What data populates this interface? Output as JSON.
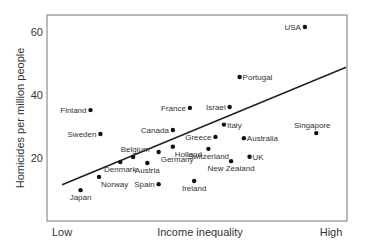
{
  "chart_data": {
    "type": "scatter",
    "title": "",
    "xlabel": "Income inequality",
    "ylabel": "Homicides per million people",
    "x_tick_labels": {
      "low": "Low",
      "high": "High"
    },
    "y_ticks": [
      20,
      40,
      60
    ],
    "ylim": [
      0,
      65
    ],
    "xlim": [
      0,
      10
    ],
    "grid": false,
    "legend": "none",
    "colors": {
      "points": "#111111",
      "trendline": "#222222",
      "frame": "#777777",
      "text": "#333333"
    },
    "trendline": {
      "x": [
        0.25,
        10.25
      ],
      "y": [
        11.5,
        48.8
      ]
    },
    "points": [
      {
        "name": "USA",
        "x": 8.8,
        "y": 61.6,
        "label_side": "left"
      },
      {
        "name": "Portugal",
        "x": 6.5,
        "y": 45.7,
        "label_side": "right"
      },
      {
        "name": "Finland",
        "x": 1.25,
        "y": 35.2,
        "label_side": "left"
      },
      {
        "name": "France",
        "x": 4.75,
        "y": 35.9,
        "label_side": "left"
      },
      {
        "name": "Israel",
        "x": 6.15,
        "y": 36.2,
        "label_side": "left"
      },
      {
        "name": "Sweden",
        "x": 1.6,
        "y": 27.6,
        "label_side": "left"
      },
      {
        "name": "Canada",
        "x": 4.15,
        "y": 28.9,
        "label_side": "left"
      },
      {
        "name": "Italy",
        "x": 5.95,
        "y": 30.6,
        "label_side": "right"
      },
      {
        "name": "Greece",
        "x": 5.65,
        "y": 26.7,
        "label_side": "left"
      },
      {
        "name": "Australia",
        "x": 6.65,
        "y": 26.3,
        "label_side": "right"
      },
      {
        "name": "Singapore",
        "x": 9.2,
        "y": 27.9,
        "label_side": "above"
      },
      {
        "name": "Holland",
        "x": 4.15,
        "y": 23.6,
        "label_side": "below-right"
      },
      {
        "name": "Switzerland",
        "x": 5.4,
        "y": 22.9,
        "label_side": "below"
      },
      {
        "name": "UK",
        "x": 6.85,
        "y": 20.4,
        "label_side": "right"
      },
      {
        "name": "Belgium",
        "x": 2.75,
        "y": 20.3,
        "label_side": "above-left"
      },
      {
        "name": "Germany",
        "x": 3.65,
        "y": 21.9,
        "label_side": "below-right"
      },
      {
        "name": "Denmark",
        "x": 2.3,
        "y": 18.7,
        "label_side": "below"
      },
      {
        "name": "Austria",
        "x": 3.25,
        "y": 18.4,
        "label_side": "below"
      },
      {
        "name": "New Zealand",
        "x": 6.2,
        "y": 19.0,
        "label_side": "below"
      },
      {
        "name": "Norway",
        "x": 1.55,
        "y": 14.0,
        "label_side": "below-right"
      },
      {
        "name": "Spain",
        "x": 3.65,
        "y": 11.7,
        "label_side": "left"
      },
      {
        "name": "Ireland",
        "x": 4.9,
        "y": 12.7,
        "label_side": "below"
      },
      {
        "name": "Japan",
        "x": 0.9,
        "y": 9.8,
        "label_side": "below"
      }
    ]
  }
}
